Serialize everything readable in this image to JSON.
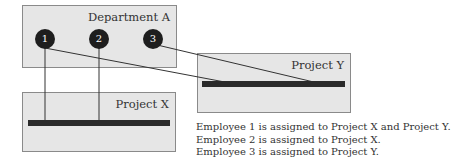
{
  "diagram": {
    "department": {
      "label": "Department A"
    },
    "employees": [
      {
        "id": "1",
        "label": "1"
      },
      {
        "id": "2",
        "label": "2"
      },
      {
        "id": "3",
        "label": "3"
      }
    ],
    "projects": [
      {
        "id": "X",
        "label": "Project X"
      },
      {
        "id": "Y",
        "label": "Project Y"
      }
    ],
    "assignments": [
      {
        "employee": "1",
        "projects": [
          "X",
          "Y"
        ]
      },
      {
        "employee": "2",
        "projects": [
          "X"
        ]
      },
      {
        "employee": "3",
        "projects": [
          "Y"
        ]
      }
    ],
    "captions": [
      "Employee 1 is assigned to Project X and Project Y.",
      "Employee 2 is assigned to Project X.",
      "Employee 3 is assigned to Project Y."
    ],
    "colors": {
      "box_fill": "#e6e6e6",
      "box_border": "#8a8a8a",
      "node_fill": "#1e1e1e",
      "bar": "#2a2a2a"
    }
  }
}
